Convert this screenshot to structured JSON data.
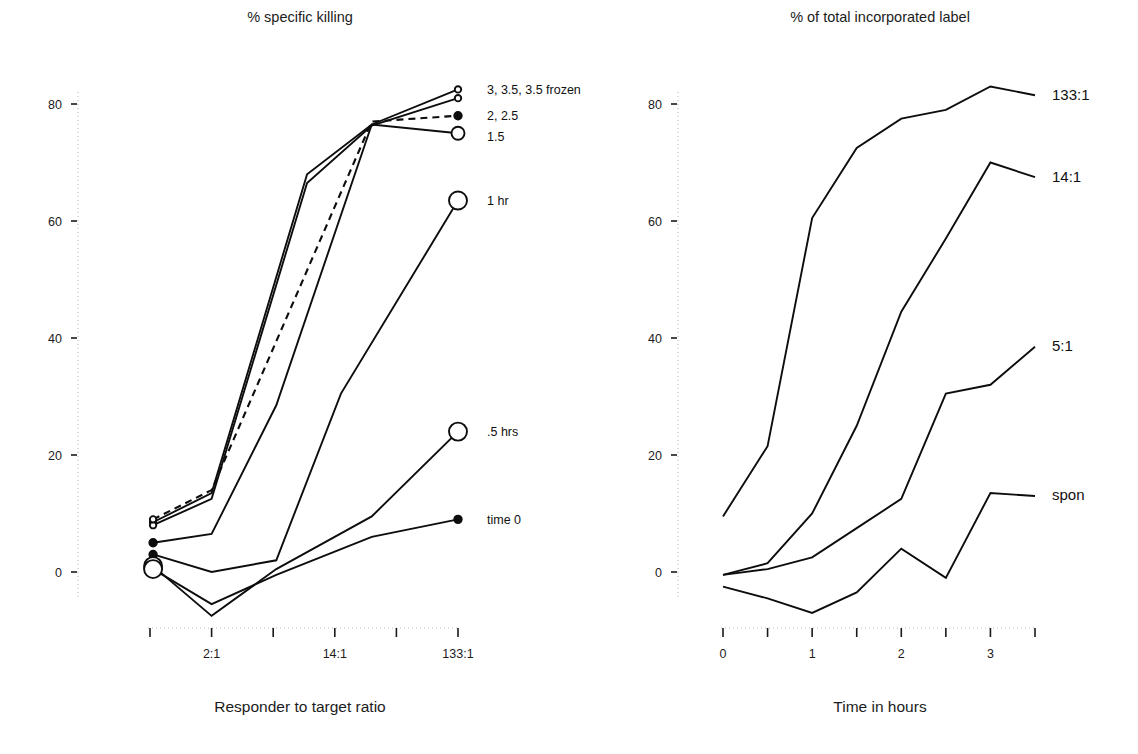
{
  "figure": {
    "width": 1138,
    "height": 754,
    "background": "#ffffff",
    "line_color": "#0d0d0d",
    "axis_color": "#b8b8b8"
  },
  "chart_data": [
    {
      "id": "left-panel",
      "type": "line",
      "title": "% specific killing",
      "xlabel": "Responder to target ratio",
      "ylabel": "",
      "grid": false,
      "legend_position": "right-inline",
      "xlim": [
        0,
        5
      ],
      "ylim": [
        -12,
        86
      ],
      "x_tick_positions": [
        0,
        1,
        2,
        3,
        4,
        5
      ],
      "x_tick_labels": [
        "",
        "2:1",
        "",
        "14:1",
        "",
        "133:1"
      ],
      "y_ticks": [
        0,
        20,
        40,
        60,
        80
      ],
      "y_tick_labels": [
        "0",
        "20",
        "40",
        "60",
        "80"
      ],
      "series": [
        {
          "name": "3, 3.5,   3.5 frozen",
          "label": "3, 3.5,   3.5 frozen",
          "style": "solid",
          "label_y": 82.5,
          "marker_start": "small-open-circle",
          "marker_end": "small-open-circle",
          "x": [
            0.05,
            1.0,
            2.55,
            3.6,
            5.0
          ],
          "values": [
            8.5,
            13.5,
            68.0,
            76.5,
            82.5
          ]
        },
        {
          "name": "3, 3.5 second",
          "label": "",
          "style": "solid",
          "label_y": 81.0,
          "marker_start": "small-open-circle",
          "marker_end": "small-open-circle",
          "x": [
            0.05,
            1.0,
            2.55,
            3.6,
            5.0
          ],
          "values": [
            8.0,
            12.5,
            66.5,
            76.3,
            81.0
          ]
        },
        {
          "name": "2, 2.5",
          "label": "2, 2.5",
          "style": "dashed",
          "label_y": 78.0,
          "marker_start": "small-open-circle",
          "marker_end": "small-filled-dot",
          "x": [
            0.05,
            1.0,
            3.6,
            5.0
          ],
          "values": [
            9.0,
            14.0,
            77.0,
            78.0
          ]
        },
        {
          "name": "1.5",
          "label": "1.5",
          "style": "solid",
          "label_y": 74.5,
          "marker_start": "small-filled-dot",
          "marker_end": "medium-open-circle",
          "x": [
            0.05,
            1.0,
            2.05,
            3.6,
            5.0
          ],
          "values": [
            5.0,
            6.5,
            28.5,
            76.5,
            75.0
          ]
        },
        {
          "name": "1 hr",
          "label": "1 hr",
          "style": "solid",
          "label_y": 63.5,
          "marker_start": "small-filled-dot",
          "marker_end": "large-open-circle",
          "x": [
            0.05,
            1.0,
            2.05,
            3.1,
            5.0
          ],
          "values": [
            3.0,
            0.0,
            2.0,
            30.5,
            63.5
          ]
        },
        {
          "name": ".5 hrs",
          "label": ".5 hrs",
          "style": "solid",
          "label_y": 24.0,
          "marker_start": "large-open-circle",
          "marker_end": "large-open-circle",
          "x": [
            0.05,
            1.0,
            2.05,
            3.6,
            5.0
          ],
          "values": [
            1.0,
            -7.5,
            0.5,
            9.5,
            24.0
          ]
        },
        {
          "name": "time 0",
          "label": "time 0",
          "style": "solid",
          "label_y": 9.0,
          "marker_start": "large-open-circle",
          "marker_end": "small-filled-dot",
          "x": [
            0.05,
            1.0,
            2.05,
            3.6,
            5.0
          ],
          "values": [
            0.5,
            -5.5,
            -0.5,
            6.0,
            9.0
          ]
        }
      ]
    },
    {
      "id": "right-panel",
      "type": "line",
      "title": "% of total incorporated label",
      "xlabel": "Time in hours",
      "ylabel": "",
      "grid": false,
      "legend_position": "right-inline",
      "xlim": [
        0,
        3.5
      ],
      "ylim": [
        -12,
        86
      ],
      "x_tick_positions": [
        0,
        0.5,
        1,
        1.5,
        2,
        2.5,
        3,
        3.5
      ],
      "x_tick_labels": [
        "0",
        "",
        "1",
        "",
        "2",
        "",
        "3",
        ""
      ],
      "y_ticks": [
        0,
        20,
        40,
        60,
        80
      ],
      "y_tick_labels": [
        "0",
        "20",
        "40",
        "60",
        "80"
      ],
      "series": [
        {
          "name": "133:1",
          "label": "133:1",
          "style": "solid",
          "label_y": 81.5,
          "x": [
            0,
            0.5,
            1,
            1.5,
            2,
            2.5,
            3,
            3.5
          ],
          "values": [
            9.5,
            21.5,
            60.5,
            72.5,
            77.5,
            79.0,
            83.0,
            81.5
          ]
        },
        {
          "name": "14:1",
          "label": "14:1",
          "style": "solid",
          "label_y": 67.5,
          "x": [
            0,
            0.5,
            1,
            1.5,
            2,
            2.5,
            3,
            3.5
          ],
          "values": [
            -0.5,
            1.5,
            10.0,
            25.0,
            44.5,
            57.0,
            70.0,
            67.5
          ]
        },
        {
          "name": "5:1",
          "label": "5:1",
          "style": "solid",
          "label_y": 38.5,
          "x": [
            0,
            0.5,
            1,
            1.5,
            2,
            2.5,
            3,
            3.5
          ],
          "values": [
            -0.5,
            0.5,
            2.5,
            7.5,
            12.5,
            30.5,
            32.0,
            38.5
          ]
        },
        {
          "name": "spon",
          "label": "spon",
          "style": "solid",
          "label_y": 13.0,
          "x": [
            0,
            0.5,
            1,
            1.5,
            2,
            2.5,
            3,
            3.5
          ],
          "values": [
            -2.5,
            -4.5,
            -7.0,
            -3.5,
            4.0,
            -1.0,
            13.5,
            13.0
          ]
        }
      ]
    }
  ]
}
